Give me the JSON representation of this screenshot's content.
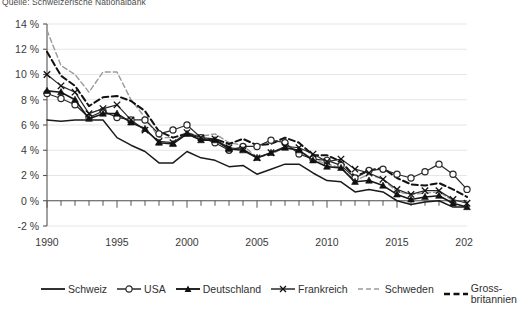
{
  "source_note": "Quelle: Schweizerische Nationalbank",
  "legend": {
    "items": [
      {
        "label": "Schweiz",
        "key": "schweiz",
        "style": "solid-plain",
        "color": "#1a1a1a",
        "marker": "none"
      },
      {
        "label": "USA",
        "key": "usa",
        "style": "solid-marker",
        "color": "#1a1a1a",
        "marker": "circle"
      },
      {
        "label": "Deutschland",
        "key": "deutschland",
        "style": "solid-marker",
        "color": "#1a1a1a",
        "marker": "triangle"
      },
      {
        "label": "Frankreich",
        "key": "frankreich",
        "style": "solid-marker",
        "color": "#1a1a1a",
        "marker": "x"
      },
      {
        "label": "Schweden",
        "key": "schweden",
        "style": "dashed-light",
        "color": "#9a9a9a",
        "marker": "none"
      },
      {
        "label": "Gross-britannien",
        "key": "grossbritannien",
        "style": "dashed-bold",
        "color": "#111111",
        "marker": "none"
      }
    ]
  },
  "colors": {
    "grid": "#e6e6e6",
    "axis": "#555555",
    "text": "#3a3a3a",
    "schweden": "#9a9a9a",
    "black": "#1a1a1a"
  },
  "chart_data": {
    "type": "line",
    "title": "",
    "subtitle": "",
    "xlabel": "",
    "ylabel": "",
    "xlim": [
      1990,
      2020
    ],
    "ylim": [
      -2,
      14
    ],
    "yticks": [
      -2,
      0,
      2,
      4,
      6,
      8,
      10,
      12,
      14
    ],
    "ytick_labels": [
      "-2 %",
      "0 %",
      "2 %",
      "4 %",
      "6 %",
      "8 %",
      "10 %",
      "12 %",
      "14 %"
    ],
    "xticks": [
      1990,
      1995,
      2000,
      2005,
      2010,
      2015,
      2020
    ],
    "xtick_labels": [
      "1990",
      "1995",
      "2000",
      "2005",
      "2010",
      "2015",
      "2020"
    ],
    "x_minor_step": 1,
    "grid": "horizontal",
    "legend_position": "bottom",
    "x": [
      1990,
      1991,
      1992,
      1993,
      1994,
      1995,
      1996,
      1997,
      1998,
      1999,
      2000,
      2001,
      2002,
      2003,
      2004,
      2005,
      2006,
      2007,
      2008,
      2009,
      2010,
      2011,
      2012,
      2013,
      2014,
      2015,
      2016,
      2017,
      2018,
      2019,
      2020
    ],
    "series": [
      {
        "name": "Schweiz",
        "key": "schweiz",
        "values": [
          6.4,
          6.3,
          6.4,
          6.4,
          6.4,
          5.0,
          4.4,
          3.9,
          3.0,
          3.0,
          3.9,
          3.4,
          3.2,
          2.7,
          2.8,
          2.1,
          2.5,
          2.9,
          2.9,
          2.2,
          1.6,
          1.5,
          0.7,
          0.9,
          0.7,
          0.0,
          -0.3,
          -0.1,
          0.0,
          -0.5,
          -0.5
        ]
      },
      {
        "name": "USA",
        "key": "usa",
        "values": [
          8.5,
          8.1,
          7.6,
          6.6,
          7.1,
          6.6,
          6.4,
          6.4,
          5.3,
          5.6,
          6.0,
          5.0,
          4.6,
          4.0,
          4.3,
          4.3,
          4.8,
          4.6,
          3.7,
          3.3,
          3.2,
          2.8,
          1.8,
          2.4,
          2.5,
          2.1,
          1.8,
          2.3,
          2.9,
          2.1,
          0.9
        ]
      },
      {
        "name": "Deutschland",
        "key": "deutschland",
        "values": [
          8.7,
          8.6,
          8.0,
          6.5,
          6.9,
          6.9,
          6.2,
          5.7,
          4.6,
          4.5,
          5.3,
          4.8,
          4.8,
          4.1,
          4.0,
          3.4,
          3.8,
          4.2,
          4.0,
          3.2,
          2.7,
          2.6,
          1.5,
          1.6,
          1.2,
          0.5,
          0.1,
          0.3,
          0.4,
          -0.2,
          -0.5
        ]
      },
      {
        "name": "Frankreich",
        "key": "frankreich",
        "values": [
          10.0,
          9.1,
          8.6,
          6.9,
          7.3,
          7.6,
          6.4,
          5.6,
          4.7,
          4.6,
          5.4,
          5.0,
          4.9,
          4.2,
          4.1,
          3.4,
          3.8,
          4.3,
          4.2,
          3.7,
          3.1,
          3.3,
          2.5,
          2.2,
          1.7,
          0.9,
          0.5,
          0.8,
          0.8,
          0.1,
          -0.2
        ]
      },
      {
        "name": "Schweden",
        "key": "schweden",
        "values": [
          13.5,
          10.7,
          10.0,
          8.6,
          10.2,
          10.2,
          8.0,
          6.6,
          5.0,
          5.0,
          5.4,
          5.1,
          5.3,
          4.6,
          4.4,
          3.4,
          3.7,
          4.2,
          4.0,
          3.3,
          2.9,
          2.6,
          1.6,
          2.1,
          1.7,
          0.7,
          0.5,
          0.6,
          0.7,
          0.0,
          -0.1
        ]
      },
      {
        "name": "Grossbritannien",
        "key": "grossbritannien",
        "values": [
          11.8,
          9.9,
          9.1,
          7.5,
          8.2,
          8.3,
          7.9,
          7.1,
          5.5,
          5.0,
          5.3,
          4.9,
          4.9,
          4.5,
          4.9,
          4.4,
          4.5,
          5.0,
          4.6,
          3.6,
          3.6,
          3.1,
          1.9,
          2.4,
          2.6,
          1.8,
          1.3,
          1.2,
          1.4,
          0.9,
          0.3
        ]
      }
    ]
  }
}
